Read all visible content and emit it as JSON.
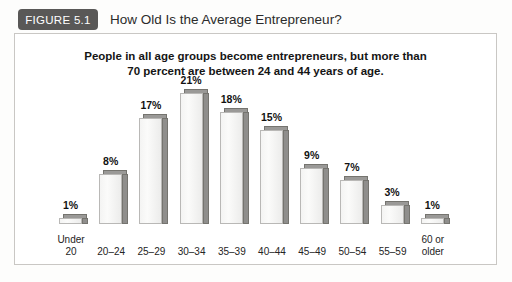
{
  "figure": {
    "badge_label": "FIGURE 5.1",
    "title": "How Old Is the Average Entrepreneur?",
    "badge_color": "#595857",
    "frame_border_color": "#c9c7c4"
  },
  "chart_data": {
    "type": "bar",
    "title": "People in all age groups become entrepreneurs, but more than 70 percent are between 24 and 44 years of age.",
    "title_line_1": "People in all age groups become entrepreneurs, but more than",
    "title_line_2": "70 percent are between 24 and 44 years of age.",
    "xlabel": "",
    "ylabel": "",
    "ylim": [
      0,
      22
    ],
    "grid": false,
    "legend": "none",
    "categories": [
      "Under 20",
      "20–24",
      "25–29",
      "30–34",
      "35–39",
      "40–44",
      "45–49",
      "50–54",
      "55–59",
      "60 or older"
    ],
    "values": [
      1,
      8,
      17,
      21,
      18,
      15,
      9,
      7,
      3,
      1
    ],
    "value_labels": [
      "1%",
      "8%",
      "17%",
      "21%",
      "18%",
      "15%",
      "9%",
      "7%",
      "3%",
      "1%"
    ],
    "bar_face_color": "#f4f4f3",
    "bar_shade_color": "#8f8e8c",
    "bars": [
      {
        "label": "Under 20",
        "label_line_1": "Under",
        "label_line_2": "20",
        "value": 1,
        "value_label": "1%"
      },
      {
        "label": "20–24",
        "label_line_1": "20–24",
        "label_line_2": "",
        "value": 8,
        "value_label": "8%"
      },
      {
        "label": "25–29",
        "label_line_1": "25–29",
        "label_line_2": "",
        "value": 17,
        "value_label": "17%"
      },
      {
        "label": "30–34",
        "label_line_1": "30–34",
        "label_line_2": "",
        "value": 21,
        "value_label": "21%"
      },
      {
        "label": "35–39",
        "label_line_1": "35–39",
        "label_line_2": "",
        "value": 18,
        "value_label": "18%"
      },
      {
        "label": "40–44",
        "label_line_1": "40–44",
        "label_line_2": "",
        "value": 15,
        "value_label": "15%"
      },
      {
        "label": "45–49",
        "label_line_1": "45–49",
        "label_line_2": "",
        "value": 9,
        "value_label": "9%"
      },
      {
        "label": "50–54",
        "label_line_1": "50–54",
        "label_line_2": "",
        "value": 7,
        "value_label": "7%"
      },
      {
        "label": "55–59",
        "label_line_1": "55–59",
        "label_line_2": "",
        "value": 3,
        "value_label": "3%"
      },
      {
        "label": "60 or older",
        "label_line_1": "60 or",
        "label_line_2": "older",
        "value": 1,
        "value_label": "1%"
      }
    ]
  }
}
